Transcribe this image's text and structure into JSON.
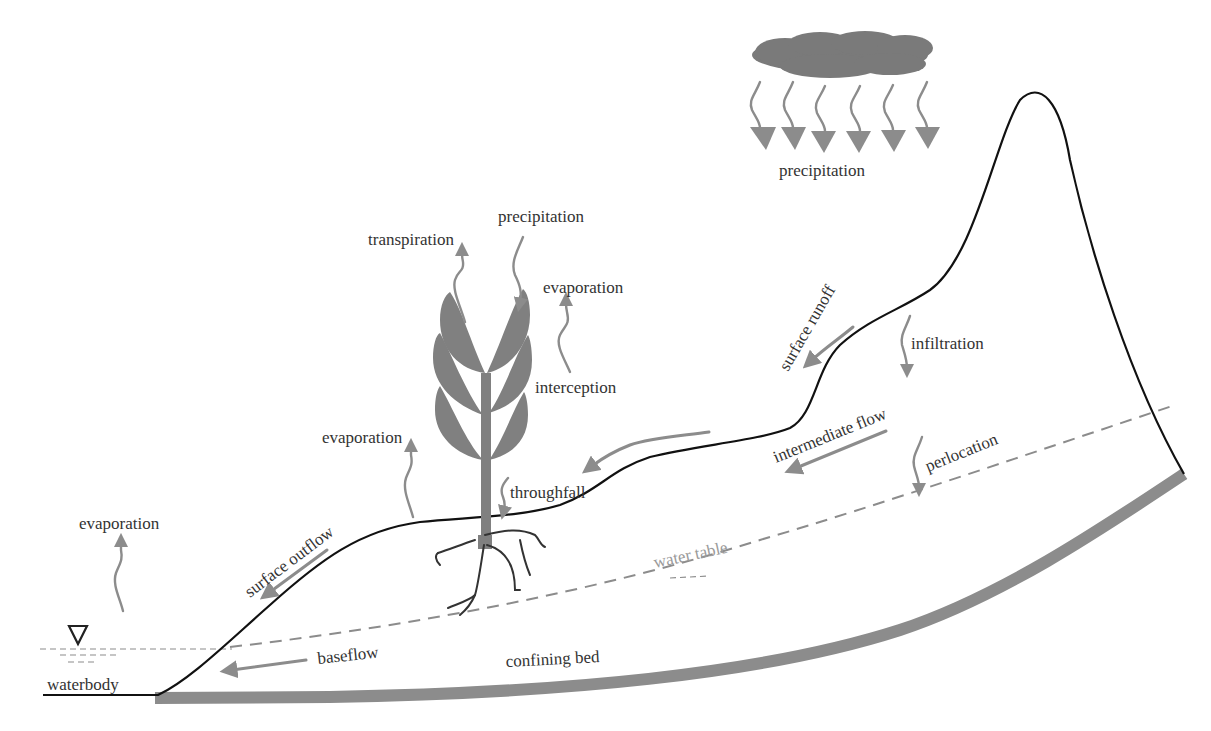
{
  "diagram": {
    "title": "",
    "colors": {
      "ground_line": "#111111",
      "process_arrow": "#8c8c8c",
      "plant": "#808080",
      "cloud": "#7a7a7a",
      "confining_bed": "#8c8c8c",
      "label_text": "#333333",
      "water_table_label": "#9a9a9a"
    },
    "labels": {
      "precipitation_cloud": "precipitation",
      "precipitation_plant": "precipitation",
      "transpiration": "transpiration",
      "evaporation_canopy": "evaporation",
      "interception": "interception",
      "evaporation_ground": "evaporation",
      "throughfall": "throughfall",
      "evaporation_waterbody": "evaporation",
      "surface_outflow": "surface outflow",
      "surface_runoff": "surface runoff",
      "infiltration": "infiltration",
      "intermediate_flow": "intermediate flow",
      "perlocation": "perlocation",
      "water_table": "water table",
      "baseflow": "baseflow",
      "confining_bed": "confining bed",
      "waterbody": "waterbody"
    },
    "icons": {
      "cloud": "cloud-icon",
      "water_level_marker": "inverted-triangle-icon",
      "plant": "plant-icon"
    }
  }
}
